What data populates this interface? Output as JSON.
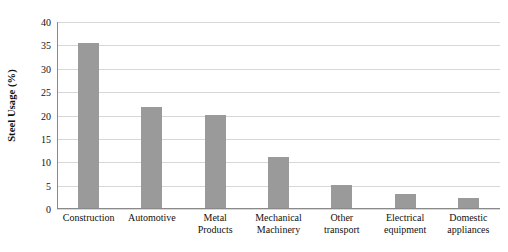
{
  "chart_data": {
    "type": "bar",
    "title": "",
    "subtitle": "",
    "xlabel": "",
    "ylabel": "Steel Usage (%)",
    "categories": [
      "Construction",
      "Automotive",
      "Metal Products",
      "Mechanical Machinery",
      "Other transport",
      "Electrical equipment",
      "Domestic appliances"
    ],
    "values": [
      35.3,
      21.7,
      19.8,
      10.9,
      5.0,
      3.0,
      2.1
    ],
    "ylim": [
      0,
      40
    ],
    "ytick_values": [
      0,
      5,
      10,
      15,
      20,
      25,
      30,
      35,
      40
    ],
    "ytick_labels": [
      "0",
      "5",
      "10",
      "15",
      "20",
      "25",
      "30",
      "35",
      "40"
    ],
    "grid": "horizontal",
    "legend": "none",
    "bar_color": "#9a9a9a",
    "gridline_color": "#d7d7d7",
    "axis_color": "#8a8a8a",
    "background_color": "#ffffff"
  },
  "x_tick_label_lines": [
    [
      "Construction"
    ],
    [
      "Automotive"
    ],
    [
      "Metal",
      "Products"
    ],
    [
      "Mechanical",
      "Machinery"
    ],
    [
      "Other",
      "transport"
    ],
    [
      "Electrical",
      "equipment"
    ],
    [
      "Domestic",
      "appliances"
    ]
  ]
}
